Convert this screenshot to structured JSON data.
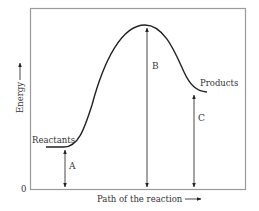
{
  "diagram": {
    "type": "energy-profile",
    "y_axis_label": "Energy",
    "x_axis_label": "Path of the reaction",
    "origin_label": "0",
    "reactants_label": "Reactants",
    "products_label": "Products",
    "arrows": [
      {
        "label": "A",
        "description": "Energy of reactants"
      },
      {
        "label": "B",
        "description": "Energy of transition state (peak)"
      },
      {
        "label": "C",
        "description": "Energy of products"
      }
    ],
    "colors": {
      "frame": "#9a9a9a",
      "curve": "#222222",
      "text": "#333333"
    }
  }
}
